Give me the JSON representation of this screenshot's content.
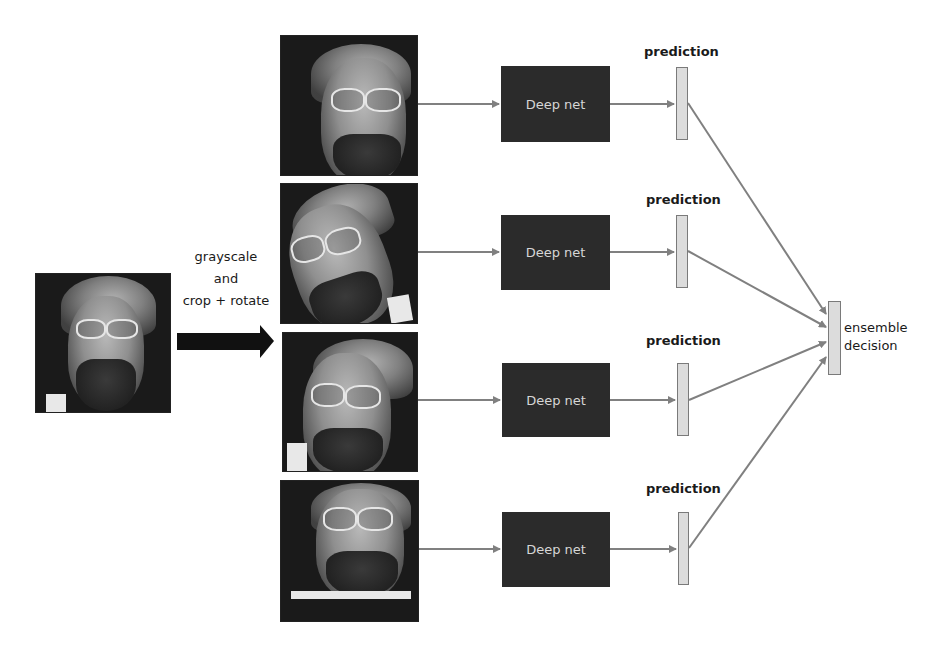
{
  "diagram": {
    "input_image": {
      "label": "input face photo"
    },
    "transform": {
      "lines": [
        "grayscale",
        "and",
        "crop + rotate"
      ]
    },
    "branches": [
      {
        "id": 1,
        "image": "augmented face crop 1",
        "model_label": "Deep net",
        "prediction_label": "prediction"
      },
      {
        "id": 2,
        "image": "augmented face crop 2 (rotated)",
        "model_label": "Deep net",
        "prediction_label": "prediction"
      },
      {
        "id": 3,
        "image": "augmented face crop 3",
        "model_label": "Deep net",
        "prediction_label": "prediction"
      },
      {
        "id": 4,
        "image": "augmented face crop 4",
        "model_label": "Deep net",
        "prediction_label": "prediction"
      }
    ],
    "output": {
      "lines": [
        "ensemble",
        "decision"
      ]
    },
    "colors": {
      "model_box": "#2b2b2b",
      "model_text": "#d6d6d6",
      "prediction_bar": "#dcdcdc",
      "connector": "#808080",
      "big_arrow": "#111111"
    }
  }
}
